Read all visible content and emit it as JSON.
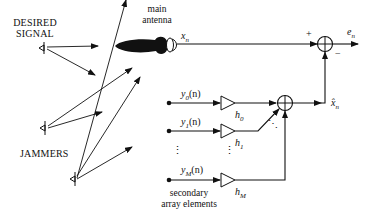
{
  "diagram": {
    "labels": {
      "desired_signal_line1": "DESIRED",
      "desired_signal_line2": "SIGNAL",
      "jammers": "JAMMERS",
      "main_antenna_line1": "main",
      "main_antenna_line2": "antenna",
      "secondary_line1": "secondary",
      "secondary_line2": "array elements",
      "x_n": "x",
      "x_n_sub": "n",
      "e_n": "e",
      "e_n_sub": "n",
      "xhat_n": "x̂",
      "xhat_n_sub": "n",
      "plus": "+",
      "minus": "−",
      "y0": "y",
      "y0_sub": "0",
      "y0_arg": "(n)",
      "y1": "y",
      "y1_sub": "1",
      "y1_arg": "(n)",
      "yM": "y",
      "yM_sub": "M",
      "yM_arg": "(n)",
      "h0": "h",
      "h0_sub": "0",
      "h1": "h",
      "h1_sub": "1",
      "hM": "h",
      "hM_sub": "M",
      "vdots": "⋮",
      "ddots": "⋱"
    },
    "nodes": [
      {
        "id": "desired-source",
        "type": "antenna-source"
      },
      {
        "id": "jammer-1",
        "type": "antenna-source"
      },
      {
        "id": "jammer-2",
        "type": "antenna-source"
      },
      {
        "id": "main-antenna",
        "type": "dish-antenna"
      },
      {
        "id": "gain-h0",
        "type": "amplifier"
      },
      {
        "id": "gain-h1",
        "type": "amplifier"
      },
      {
        "id": "gain-hM",
        "type": "amplifier"
      },
      {
        "id": "sum-weights",
        "type": "summer"
      },
      {
        "id": "sum-output",
        "type": "summer"
      }
    ],
    "edges": [
      {
        "from": "main-antenna",
        "to": "sum-output",
        "label": "x_n",
        "sign": "+"
      },
      {
        "from": "sum-weights",
        "to": "sum-output",
        "label": "x̂_n",
        "sign": "−"
      },
      {
        "from": "sum-output",
        "to": "output",
        "label": "e_n"
      },
      {
        "from": "y0(n)",
        "to": "gain-h0"
      },
      {
        "from": "y1(n)",
        "to": "gain-h1"
      },
      {
        "from": "yM(n)",
        "to": "gain-hM"
      },
      {
        "from": "gain-h0",
        "to": "sum-weights"
      },
      {
        "from": "gain-h1",
        "to": "sum-weights"
      },
      {
        "from": "gain-hM",
        "to": "sum-weights"
      }
    ],
    "colors": {
      "stroke": "#111111",
      "background": "#ffffff"
    }
  }
}
